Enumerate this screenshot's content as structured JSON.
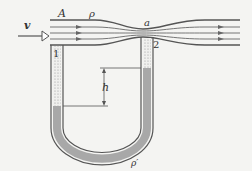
{
  "diagram": {
    "labels": {
      "velocity": "v",
      "area": "A",
      "density_fluid": "ρ",
      "throat_area": "a",
      "point1": "1",
      "point2": "2",
      "height_diff": "h",
      "density_manometer": "ρ′"
    },
    "colors": {
      "background": "#f4f4f2",
      "lines": "#555555",
      "manometer_fluid": "#a8a8a8",
      "dotted_fill": "#d8d8d8"
    }
  }
}
